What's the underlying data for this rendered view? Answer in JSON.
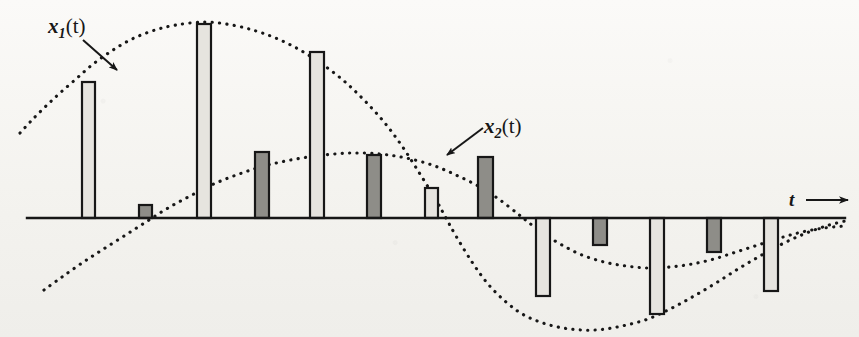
{
  "figure": {
    "kind": "sampled-signal-waveform",
    "background_color": "#f5f4f0",
    "ink_color": "#171717",
    "light_bar_fill": "#e6e4df",
    "dark_bar_fill": "#8e8d88",
    "axis_y": 218,
    "axis_x_start": 27,
    "axis_x_end": 845
  },
  "labels": {
    "signal1": {
      "base": "x",
      "sub": "1",
      "arg": "(t)",
      "text": "x1(t)"
    },
    "signal2": {
      "base": "x",
      "sub": "2",
      "arg": "(t)",
      "text": "x2(t)"
    },
    "time_axis": {
      "text": "t"
    }
  },
  "chart_data": {
    "type": "bar",
    "title": "",
    "xlabel": "t",
    "ylabel": "",
    "grid": false,
    "legend": [
      "x1(t)",
      "x2(t)"
    ],
    "legend_position": "inline-annotations",
    "axis_baseline_y": 218,
    "xlim": [
      27,
      845
    ],
    "curves": [
      {
        "name": "x1(t)",
        "style": "dotted",
        "points": [
          [
            20,
            133
          ],
          [
            32,
            120
          ],
          [
            46,
            106
          ],
          [
            60,
            93
          ],
          [
            76,
            79
          ],
          [
            92,
            65
          ],
          [
            110,
            52
          ],
          [
            130,
            40
          ],
          [
            152,
            31
          ],
          [
            176,
            25
          ],
          [
            205,
            22
          ],
          [
            232,
            25
          ],
          [
            256,
            31
          ],
          [
            278,
            39
          ],
          [
            300,
            50
          ],
          [
            322,
            64
          ],
          [
            344,
            81
          ],
          [
            364,
            100
          ],
          [
            384,
            122
          ],
          [
            402,
            146
          ],
          [
            420,
            174
          ],
          [
            436,
            200
          ],
          [
            446,
            218
          ],
          [
            456,
            236
          ],
          [
            472,
            262
          ],
          [
            488,
            284
          ],
          [
            506,
            302
          ],
          [
            524,
            315
          ],
          [
            546,
            324
          ],
          [
            570,
            329
          ],
          [
            596,
            330
          ],
          [
            622,
            326
          ],
          [
            648,
            319
          ],
          [
            672,
            308
          ],
          [
            694,
            296
          ],
          [
            716,
            283
          ],
          [
            738,
            269
          ],
          [
            760,
            256
          ],
          [
            782,
            244
          ],
          [
            804,
            234
          ],
          [
            826,
            226
          ],
          [
            845,
            221
          ]
        ]
      },
      {
        "name": "x2(t)",
        "style": "dotted",
        "points": [
          [
            44,
            290
          ],
          [
            62,
            277
          ],
          [
            82,
            263
          ],
          [
            102,
            250
          ],
          [
            124,
            236
          ],
          [
            146,
            222
          ],
          [
            168,
            208
          ],
          [
            192,
            195
          ],
          [
            216,
            183
          ],
          [
            242,
            173
          ],
          [
            268,
            165
          ],
          [
            296,
            159
          ],
          [
            324,
            155
          ],
          [
            352,
            153
          ],
          [
            380,
            154
          ],
          [
            406,
            158
          ],
          [
            432,
            165
          ],
          [
            456,
            175
          ],
          [
            480,
            187
          ],
          [
            500,
            200
          ],
          [
            518,
            214
          ],
          [
            528,
            222
          ],
          [
            544,
            234
          ],
          [
            562,
            245
          ],
          [
            582,
            255
          ],
          [
            604,
            262
          ],
          [
            626,
            266
          ],
          [
            648,
            268
          ],
          [
            670,
            267
          ],
          [
            692,
            264
          ],
          [
            714,
            259
          ],
          [
            736,
            252
          ],
          [
            758,
            245
          ],
          [
            780,
            238
          ],
          [
            802,
            232
          ],
          [
            824,
            228
          ],
          [
            845,
            226
          ]
        ]
      }
    ],
    "bars": [
      {
        "index": 1,
        "series": "x1(t)",
        "x": 82,
        "width": 13,
        "top": 82,
        "bottom": 218,
        "value": 136,
        "fill": "light"
      },
      {
        "index": 2,
        "series": "x2(t)",
        "x": 139,
        "width": 13,
        "top": 205,
        "bottom": 218,
        "value": 13,
        "fill": "dark"
      },
      {
        "index": 3,
        "series": "x1(t)",
        "x": 197,
        "width": 14,
        "top": 24,
        "bottom": 218,
        "value": 194,
        "fill": "light"
      },
      {
        "index": 4,
        "series": "x2(t)",
        "x": 255,
        "width": 14,
        "top": 152,
        "bottom": 218,
        "value": 66,
        "fill": "dark"
      },
      {
        "index": 5,
        "series": "x1(t)",
        "x": 310,
        "width": 14,
        "top": 52,
        "bottom": 218,
        "value": 166,
        "fill": "light"
      },
      {
        "index": 6,
        "series": "x2(t)",
        "x": 367,
        "width": 14,
        "top": 155,
        "bottom": 218,
        "value": 63,
        "fill": "dark"
      },
      {
        "index": 7,
        "series": "x1(t)",
        "x": 425,
        "width": 13,
        "top": 188,
        "bottom": 218,
        "value": 30,
        "fill": "light"
      },
      {
        "index": 8,
        "series": "x2(t)",
        "x": 478,
        "width": 15,
        "top": 157,
        "bottom": 218,
        "value": 61,
        "fill": "dark"
      },
      {
        "index": 9,
        "series": "x1(t)",
        "x": 536,
        "width": 14,
        "top": 218,
        "bottom": 296,
        "value": -78,
        "fill": "light"
      },
      {
        "index": 10,
        "series": "x2(t)",
        "x": 593,
        "width": 14,
        "top": 218,
        "bottom": 245,
        "value": -27,
        "fill": "dark"
      },
      {
        "index": 11,
        "series": "x1(t)",
        "x": 650,
        "width": 14,
        "top": 218,
        "bottom": 314,
        "value": -96,
        "fill": "light"
      },
      {
        "index": 12,
        "series": "x2(t)",
        "x": 707,
        "width": 14,
        "top": 218,
        "bottom": 252,
        "value": -34,
        "fill": "dark"
      },
      {
        "index": 13,
        "series": "x1(t)",
        "x": 764,
        "width": 14,
        "top": 218,
        "bottom": 291,
        "value": -73,
        "fill": "light"
      }
    ],
    "annotations": [
      {
        "name": "x1-pointer",
        "label": "x1(t)",
        "from": [
          83,
          40
        ],
        "to": [
          117,
          70
        ]
      },
      {
        "name": "x2-pointer",
        "label": "x2(t)",
        "from": [
          483,
          128
        ],
        "to": [
          447,
          155
        ]
      },
      {
        "name": "t-arrow",
        "label": "t",
        "from": [
          806,
          200
        ],
        "to": [
          848,
          200
        ]
      }
    ]
  }
}
